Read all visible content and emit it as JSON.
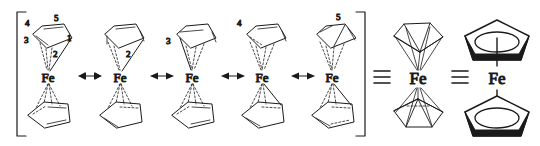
{
  "diagram": {
    "type": "chemical-structure-resonance",
    "background_color": "#ffffff",
    "line_color": "#1a1a1a",
    "metal_label": "Fe",
    "bracket": {
      "left": "[",
      "right": "]",
      "encloses_structures": 5
    },
    "resonance_arrow": "↔",
    "equivalence_symbol": "≡",
    "resonance_structures": [
      {
        "index": 1,
        "metal": "Fe",
        "ring_position_labels": [
          "1",
          "2",
          "3",
          "4",
          "5"
        ],
        "description": "eta2-bound top cyclopentadienyl with numbered carbons"
      },
      {
        "index": 2,
        "metal": "Fe",
        "ring_position_labels": [
          "2"
        ],
        "description": "eta2 coordination at C1-C2"
      },
      {
        "index": 3,
        "metal": "Fe",
        "ring_position_labels": [
          "3"
        ],
        "description": "eta2 coordination at C2-C3"
      },
      {
        "index": 4,
        "metal": "Fe",
        "ring_position_labels": [
          "4"
        ],
        "description": "eta2 coordination at C3-C4"
      },
      {
        "index": 5,
        "metal": "Fe",
        "ring_position_labels": [
          "5"
        ],
        "description": "eta2 coordination at C4-C5"
      }
    ],
    "equivalent_representations": [
      {
        "index": 1,
        "metal": "Fe",
        "style": "perspective-sandwich",
        "description": "3D perspective ferrocene with solid cyclopentadienyl rings"
      },
      {
        "index": 2,
        "metal": "Fe",
        "style": "circle-in-pentagon-sandwich",
        "description": "classic ferrocene sandwich, filled pentagons with inscribed circles"
      }
    ],
    "labels": {
      "n1": "1",
      "n2": "2",
      "n3": "3",
      "n4": "4",
      "n5": "5",
      "s2_n2": "2",
      "s3_n3": "3",
      "s4_n4": "4",
      "s5_n5": "5"
    }
  }
}
